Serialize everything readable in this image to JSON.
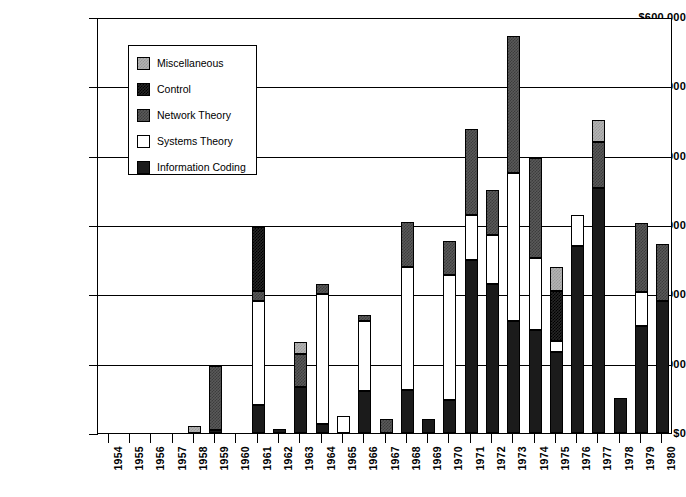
{
  "chart_data": {
    "type": "bar",
    "stacked": true,
    "title": "",
    "subtitle": "",
    "xlabel": "",
    "ylabel": "",
    "ylim": [
      0,
      600000
    ],
    "ytick_values": [
      0,
      100000,
      200000,
      300000,
      400000,
      500000,
      600000
    ],
    "ytick_labels": [
      "$0",
      "$100,000",
      "$200,000",
      "$300,000",
      "$400,000",
      "$500,000",
      "$600,000"
    ],
    "grid": true,
    "grid_axis": "y",
    "legend_position": "upper-left-inside",
    "categories": [
      "1954",
      "1955",
      "1956",
      "1957",
      "1958",
      "1959",
      "1960",
      "1961",
      "1962",
      "1963",
      "1964",
      "1965",
      "1966",
      "1967",
      "1968",
      "1969",
      "1970",
      "1971",
      "1972",
      "1973",
      "1974",
      "1975",
      "1976",
      "1977",
      "1978",
      "1979",
      "1980"
    ],
    "series": [
      {
        "name": "Information Coding",
        "swatch": "information-coding-swatch",
        "color": "#1b1b1b",
        "values": [
          0,
          0,
          0,
          0,
          0,
          4000,
          0,
          40000,
          6000,
          67000,
          13000,
          0,
          60000,
          0,
          62000,
          20000,
          48000,
          250000,
          215000,
          162000,
          148000,
          117000,
          270000,
          353000,
          50000,
          155000,
          190000
        ]
      },
      {
        "name": "Systems Theory",
        "swatch": "systems-theory-swatch",
        "color": "#ffffff",
        "values": [
          0,
          0,
          0,
          0,
          0,
          0,
          0,
          150000,
          0,
          0,
          187000,
          25000,
          102000,
          0,
          178000,
          0,
          180000,
          65000,
          70000,
          213000,
          105000,
          16000,
          45000,
          0,
          0,
          48000,
          0
        ]
      },
      {
        "name": "Network Theory",
        "swatch": "network-theory-swatch",
        "color": "#5a5a5a",
        "values": [
          0,
          0,
          0,
          0,
          0,
          93000,
          0,
          15000,
          0,
          47000,
          15000,
          0,
          8000,
          20000,
          65000,
          0,
          49000,
          123000,
          65000,
          198000,
          144000,
          0,
          0,
          67000,
          0,
          100000,
          83000
        ]
      },
      {
        "name": "Control",
        "swatch": "control-swatch",
        "color": "#262626",
        "values": [
          0,
          0,
          0,
          0,
          0,
          0,
          0,
          92000,
          0,
          0,
          0,
          0,
          0,
          0,
          0,
          0,
          0,
          0,
          0,
          0,
          0,
          72000,
          0,
          0,
          0,
          0,
          0
        ]
      },
      {
        "name": "Miscellaneous",
        "swatch": "miscellaneous-swatch",
        "color": "#b4b4b4",
        "values": [
          0,
          0,
          0,
          0,
          10000,
          0,
          0,
          0,
          0,
          18000,
          0,
          0,
          0,
          0,
          0,
          0,
          0,
          0,
          0,
          0,
          0,
          35000,
          0,
          32000,
          0,
          0,
          0
        ]
      }
    ],
    "totals": [
      0,
      0,
      0,
      0,
      10000,
      97000,
      0,
      297000,
      6000,
      132000,
      215000,
      25000,
      170000,
      20000,
      305000,
      20000,
      277000,
      438000,
      350000,
      573000,
      397000,
      240000,
      315000,
      452000,
      50000,
      303000,
      273000
    ]
  },
  "legend": {
    "items": [
      {
        "label": "Miscellaneous",
        "key": "miscellaneous"
      },
      {
        "label": "Control",
        "key": "control"
      },
      {
        "label": "Network Theory",
        "key": "network-theory"
      },
      {
        "label": "Systems Theory",
        "key": "systems-theory"
      },
      {
        "label": "Information Coding",
        "key": "information-coding"
      }
    ]
  }
}
